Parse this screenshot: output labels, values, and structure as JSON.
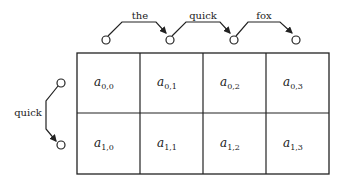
{
  "diagram": {
    "type": "chain-over-grid",
    "top_chain": {
      "edges": [
        {
          "label": "the"
        },
        {
          "label": "quick"
        },
        {
          "label": "fox"
        }
      ],
      "node_count": 4
    },
    "left_chain": {
      "edges": [
        {
          "label": "quick"
        }
      ],
      "node_count": 2
    },
    "grid": {
      "rows": 2,
      "cols": 4,
      "cells": [
        [
          {
            "base": "a",
            "sub": "0,0"
          },
          {
            "base": "a",
            "sub": "0,1"
          },
          {
            "base": "a",
            "sub": "0,2"
          },
          {
            "base": "a",
            "sub": "0,3"
          }
        ],
        [
          {
            "base": "a",
            "sub": "1,0"
          },
          {
            "base": "a",
            "sub": "1,1"
          },
          {
            "base": "a",
            "sub": "1,2"
          },
          {
            "base": "a",
            "sub": "1,3"
          }
        ]
      ]
    },
    "colors": {
      "stroke": "#222222",
      "background": "#ffffff"
    }
  }
}
